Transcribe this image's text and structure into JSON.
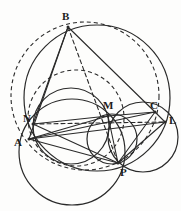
{
  "figure": {
    "width": 181,
    "height": 211,
    "background_color": "#fdfdfc",
    "stroke_color": "#2a2a2a",
    "label_color": "#1c1c1c"
  },
  "points": [
    {
      "id": "B",
      "label": "B",
      "x": 68,
      "y": 27,
      "label_x": 62,
      "label_y": 11
    },
    {
      "id": "N",
      "label": "N",
      "x": 33,
      "y": 124,
      "label_x": 23,
      "label_y": 113
    },
    {
      "id": "A",
      "label": "A",
      "x": 29,
      "y": 139,
      "label_x": 14,
      "label_y": 137
    },
    {
      "id": "M",
      "label": "M",
      "x": 108,
      "y": 116,
      "label_x": 103,
      "label_y": 100
    },
    {
      "id": "C",
      "label": "C",
      "x": 155,
      "y": 112,
      "label_x": 150,
      "label_y": 100
    },
    {
      "id": "L",
      "label": "L",
      "x": 165,
      "y": 122,
      "label_x": 169,
      "label_y": 115
    },
    {
      "id": "P",
      "label": "P",
      "x": 118,
      "y": 163,
      "label_x": 120,
      "label_y": 167
    }
  ],
  "circles": [
    {
      "id": "circumcircle-abc",
      "name": "circumcircle-abc",
      "cx": 97,
      "cy": 98,
      "r": 73,
      "style": "solid"
    },
    {
      "id": "dashed-circle",
      "name": "dashed-circle",
      "cx": 85,
      "cy": 96,
      "r": 74,
      "style": "dashed"
    },
    {
      "id": "circle-anp",
      "name": "circle-a-n-p",
      "cx": 72,
      "cy": 152,
      "r": 53,
      "style": "solid"
    },
    {
      "id": "circle-nm",
      "name": "circle-n-m-p",
      "cx": 71,
      "cy": 126,
      "r": 38,
      "style": "solid"
    },
    {
      "id": "circle-mclp",
      "name": "circle-m-c-l-p",
      "cx": 143,
      "cy": 137,
      "r": 35,
      "style": "solid"
    },
    {
      "id": "circle-small-mp",
      "name": "circle-small-m-p",
      "cx": 112,
      "cy": 139,
      "r": 25,
      "style": "solid"
    },
    {
      "id": "dashed-arc-ap",
      "name": "dashed-arc-a-p",
      "cx": 76,
      "cy": 118,
      "r": 48,
      "style": "dashed"
    }
  ],
  "lines": [
    {
      "id": "BA",
      "name": "segment-b-a",
      "from": "B",
      "to": "A",
      "style": "solid"
    },
    {
      "id": "BC",
      "name": "segment-b-c",
      "from": "B",
      "to": "C",
      "style": "solid"
    },
    {
      "id": "BN",
      "name": "segment-b-n",
      "from": "B",
      "to": "N",
      "style": "solid"
    },
    {
      "id": "BP",
      "name": "segment-b-p",
      "from": "B",
      "to": "P",
      "style": "dashed"
    },
    {
      "id": "NM",
      "name": "segment-n-m",
      "from": "N",
      "to": "M",
      "style": "solid"
    },
    {
      "id": "MC",
      "name": "segment-m-c",
      "from": "M",
      "to": "C",
      "style": "solid"
    },
    {
      "id": "NL",
      "name": "segment-n-l",
      "from": "N",
      "to": "L",
      "style": "dashed"
    },
    {
      "id": "AC",
      "name": "segment-a-c",
      "from": "A",
      "to": "C",
      "style": "solid"
    },
    {
      "id": "AL",
      "name": "segment-a-l",
      "from": "A",
      "to": "L",
      "style": "solid"
    },
    {
      "id": "AM",
      "name": "segment-a-m",
      "from": "A",
      "to": "M",
      "style": "solid"
    },
    {
      "id": "AP",
      "name": "segment-a-p",
      "from": "A",
      "to": "P",
      "style": "solid"
    },
    {
      "id": "NP",
      "name": "segment-n-p",
      "from": "N",
      "to": "P",
      "style": "solid"
    },
    {
      "id": "MP",
      "name": "segment-m-p",
      "from": "M",
      "to": "P",
      "style": "solid"
    },
    {
      "id": "PL",
      "name": "segment-p-l",
      "from": "P",
      "to": "L",
      "style": "solid"
    },
    {
      "id": "PC",
      "name": "segment-p-c",
      "from": "P",
      "to": "C",
      "style": "solid"
    },
    {
      "id": "CL",
      "name": "segment-c-l",
      "from": "C",
      "to": "L",
      "style": "solid"
    }
  ]
}
